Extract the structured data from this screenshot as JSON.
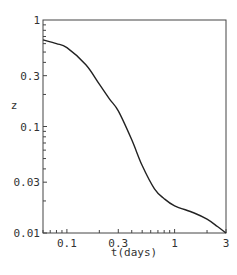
{
  "chart_data": {
    "type": "line",
    "title": "",
    "xlabel": "t(days)",
    "ylabel": "z",
    "xscale": "log",
    "yscale": "log",
    "xlim": [
      0.06,
      3
    ],
    "ylim": [
      0.01,
      1
    ],
    "grid": false,
    "legend": null,
    "x_ticks": [
      {
        "value": 0.1,
        "label": "0.1"
      },
      {
        "value": 0.3,
        "label": "0.3"
      },
      {
        "value": 1,
        "label": "1"
      },
      {
        "value": 3,
        "label": "3"
      }
    ],
    "y_ticks": [
      {
        "value": 1,
        "label": "1"
      },
      {
        "value": 0.3,
        "label": "0.3"
      },
      {
        "value": 0.1,
        "label": "0.1"
      },
      {
        "value": 0.03,
        "label": "0.03"
      },
      {
        "value": 0.01,
        "label": "0.01"
      }
    ],
    "series": [
      {
        "name": "z(t)",
        "color": "#222222",
        "x": [
          0.06,
          0.08,
          0.1,
          0.15,
          0.2,
          0.25,
          0.3,
          0.4,
          0.5,
          0.65,
          0.8,
          1.0,
          1.5,
          2.0,
          2.5,
          3.0
        ],
        "y": [
          0.65,
          0.6,
          0.55,
          0.38,
          0.25,
          0.18,
          0.14,
          0.075,
          0.043,
          0.026,
          0.021,
          0.018,
          0.0155,
          0.0135,
          0.0115,
          0.01
        ]
      }
    ]
  }
}
